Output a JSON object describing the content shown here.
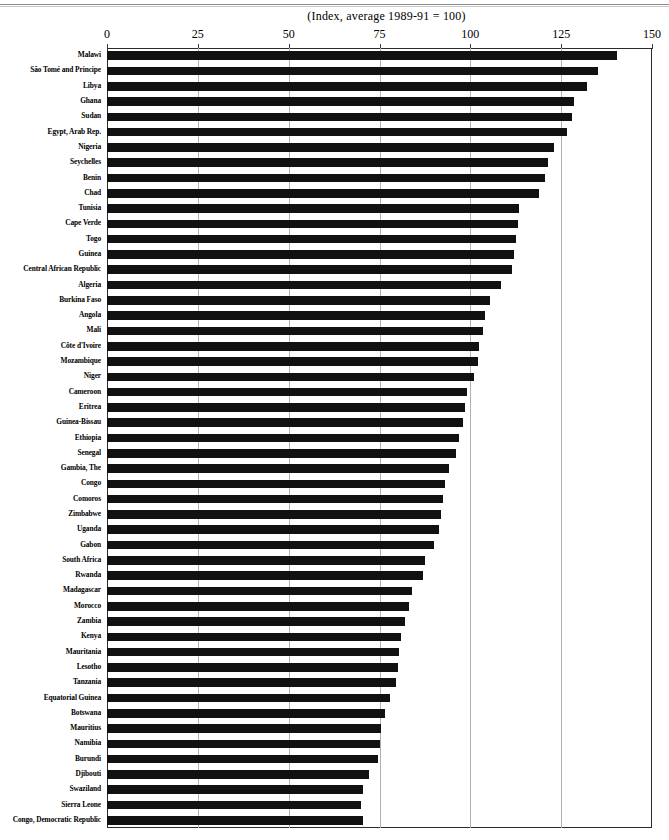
{
  "page": {
    "axis_units_note": "(Index, average 1989-91 = 100)"
  },
  "chart_data": {
    "type": "bar",
    "orientation": "horizontal",
    "title": "",
    "subtitle": "(Index, average 1989-91 = 100)",
    "xlabel": "",
    "ylabel": "",
    "xlim": [
      0,
      150
    ],
    "xticks": [
      0,
      25,
      50,
      75,
      100,
      125,
      150
    ],
    "xtick_labels": [
      "0",
      "25",
      "50",
      "75",
      "100",
      "125",
      "150"
    ],
    "grid": true,
    "grid_axis": "x",
    "legend": false,
    "bar_color": "#111111",
    "sorted": "descending",
    "categories": [
      "Malawi",
      "São Tomé and Principe",
      "Libya",
      "Ghana",
      "Sudan",
      "Egypt,  Arab Rep.",
      "Nigeria",
      "Seychelles",
      "Benin",
      "Chad",
      "Tunisia",
      "Cape Verde",
      "Togo",
      "Guinea",
      "Central African Republic",
      "Algeria",
      "Burkina Faso",
      "Angola",
      "Mali",
      "Côte d'Ivoire",
      "Mozambique",
      "Niger",
      "Cameroon",
      "Eritrea",
      "Guinea-Bissau",
      "Ethiopia",
      "Senegal",
      "Gambia, The",
      "Congo",
      "Comoros",
      "Zimbabwe",
      "Uganda",
      "Gabon",
      "South Africa",
      "Rwanda",
      "Madagascar",
      "Morocco",
      "Zambia",
      "Kenya",
      "Mauritania",
      "Lesotho",
      "Tanzania",
      "Equatorial Guinea",
      "Botswana",
      "Mauritius",
      "Namibia",
      "Burundi",
      "Djibouti",
      "Swaziland",
      "Sierra Leone",
      "Congo, Democratic  Republic"
    ],
    "values": [
      140.5,
      135.0,
      132.0,
      128.5,
      128.0,
      126.5,
      123.0,
      121.5,
      120.5,
      119.0,
      113.5,
      113.0,
      112.5,
      112.0,
      111.5,
      108.5,
      105.5,
      104.0,
      103.5,
      102.5,
      102.0,
      101.0,
      99.0,
      98.5,
      98.0,
      97.0,
      96.0,
      94.0,
      93.0,
      92.5,
      92.0,
      91.5,
      90.0,
      87.5,
      87.0,
      84.0,
      83.0,
      82.0,
      81.0,
      80.5,
      80.0,
      79.5,
      78.0,
      76.5,
      75.5,
      75.0,
      74.5,
      72.0,
      70.5,
      70.0,
      70.5
    ]
  }
}
